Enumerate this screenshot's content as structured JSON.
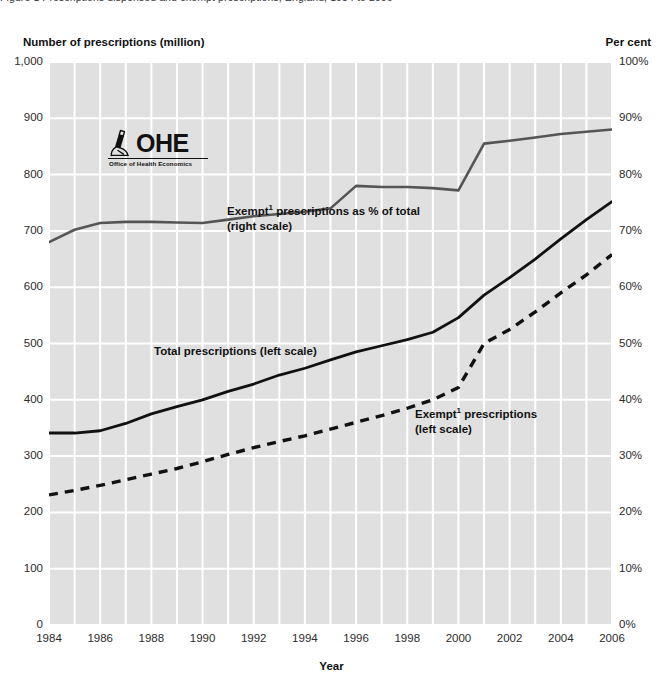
{
  "caption": {
    "clipped_text": "Figure 1   Prescriptions dispensed and exempt prescriptions, England, 1984 to 2006"
  },
  "axes": {
    "left_title": "Number of prescriptions (million)",
    "right_title": "Per cent",
    "x_title": "Year",
    "left_ticks": [
      "1,000",
      "900",
      "800",
      "700",
      "600",
      "500",
      "400",
      "300",
      "200",
      "100",
      "0"
    ],
    "left_values": [
      1000,
      900,
      800,
      700,
      600,
      500,
      400,
      300,
      200,
      100,
      0
    ],
    "right_ticks": [
      "100%",
      "90%",
      "80%",
      "70%",
      "60%",
      "50%",
      "40%",
      "30%",
      "20%",
      "10%",
      "0%"
    ],
    "right_values": [
      100,
      90,
      80,
      70,
      60,
      50,
      40,
      30,
      20,
      10,
      0
    ],
    "x_ticks": [
      "1984",
      "1986",
      "1988",
      "1990",
      "1992",
      "1994",
      "1996",
      "1998",
      "2000",
      "2002",
      "2004",
      "2006"
    ],
    "x_values": [
      1984,
      1986,
      1988,
      1990,
      1992,
      1994,
      1996,
      1998,
      2000,
      2002,
      2004,
      2006
    ]
  },
  "annotations": {
    "exempt_pct_line1": "Exempt",
    "exempt_pct_sup": "1",
    "exempt_pct_line1b": " prescriptions as % of total",
    "exempt_pct_line2": "(right  scale)",
    "total_label": "Total prescriptions (left scale)",
    "exempt_abs_line1": "Exempt",
    "exempt_abs_sup": "1",
    "exempt_abs_line1b": " prescriptions",
    "exempt_abs_line2": "(left scale)"
  },
  "logo": {
    "wordmark": "OHE",
    "tagline": "Office of Health Economics",
    "icon": "microscope-icon"
  },
  "colors": {
    "plot_background": "#e0e0e0",
    "gridline": "#ffffff",
    "total_line": "#111111",
    "exempt_pct_line": "#555555",
    "exempt_abs_line": "#111111",
    "text": "#1a1a1a"
  },
  "chart_data": {
    "type": "line",
    "title": "",
    "xlabel": "Year",
    "ylabel": "Number of prescriptions (million)",
    "y2label": "Per cent",
    "xlim": [
      1984,
      2006
    ],
    "ylim": [
      0,
      1000
    ],
    "y2lim": [
      0,
      100
    ],
    "grid": true,
    "legend": "in-plot annotations",
    "x": [
      1984,
      1985,
      1986,
      1987,
      1988,
      1989,
      1990,
      1991,
      1992,
      1993,
      1994,
      1995,
      1996,
      1997,
      1998,
      1999,
      2000,
      2001,
      2002,
      2003,
      2004,
      2005,
      2006
    ],
    "series": [
      {
        "name": "Total prescriptions (left scale)",
        "axis": "left",
        "unit": "million",
        "style": "solid",
        "color": "#111111",
        "values": [
          341,
          341,
          345,
          358,
          375,
          388,
          400,
          415,
          428,
          444,
          456,
          471,
          485,
          496,
          507,
          520,
          546,
          586,
          617,
          650,
          686,
          720,
          752
        ]
      },
      {
        "name": "Exempt prescriptions (left scale)",
        "axis": "left",
        "unit": "million",
        "style": "dashed",
        "color": "#111111",
        "values": [
          231,
          239,
          248,
          258,
          268,
          278,
          290,
          303,
          315,
          326,
          336,
          348,
          360,
          372,
          385,
          400,
          422,
          500,
          525,
          556,
          590,
          622,
          658
        ]
      },
      {
        "name": "Exempt prescriptions as % of total (right scale)",
        "axis": "right",
        "unit": "per cent",
        "style": "solid",
        "color": "#555555",
        "values": [
          68.0,
          70.2,
          71.4,
          71.6,
          71.6,
          71.5,
          71.4,
          72.0,
          72.6,
          73.0,
          73.4,
          74.0,
          78.0,
          77.8,
          77.8,
          77.6,
          77.2,
          85.5,
          86.0,
          86.6,
          87.2,
          87.6,
          88.0
        ]
      }
    ]
  }
}
